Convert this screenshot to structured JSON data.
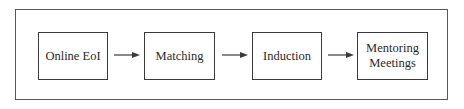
{
  "diagram": {
    "type": "flowchart",
    "direction": "left-to-right",
    "steps": [
      {
        "label": "Online EoI"
      },
      {
        "label": "Matching"
      },
      {
        "label": "Induction"
      },
      {
        "label": "Mentoring Meetings",
        "lines": [
          "Mentoring",
          "Meetings"
        ]
      }
    ],
    "connectors": [
      {
        "from": "Online EoI",
        "to": "Matching"
      },
      {
        "from": "Matching",
        "to": "Induction"
      },
      {
        "from": "Induction",
        "to": "Mentoring Meetings"
      }
    ],
    "colors": {
      "line": "#3a3a3a",
      "frame": "#5a5a5a",
      "background": "#ffffff"
    }
  }
}
